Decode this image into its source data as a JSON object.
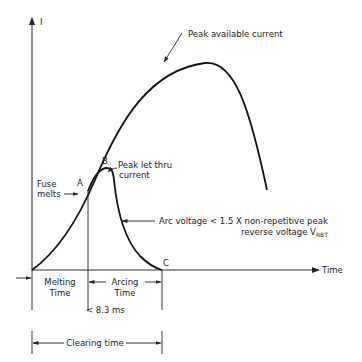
{
  "diagram": {
    "axes": {
      "y_label": "I",
      "x_label": "Time"
    },
    "points": {
      "a": "A",
      "b": "B",
      "c": "C"
    },
    "annotations": {
      "peak_available": "Peak available current",
      "peak_let_thru_line1": "Peak let thru",
      "peak_let_thru_line2": "current",
      "fuse_melts_line1": "Fuse",
      "fuse_melts_line2": "melts",
      "arc_voltage_line1": "Arc voltage < 1.5 X non-repetitive peak",
      "arc_voltage_line2": "reverse voltage V",
      "arc_voltage_subscript": "RBT"
    },
    "intervals": {
      "melting_line1": "Melting",
      "melting_line2": "Time",
      "arcing_line1": "Arcing",
      "arcing_line2": "Time",
      "total_limit": "< 8.3 ms",
      "clearing": "Clearing time"
    }
  },
  "colors": {
    "line": "#111111",
    "background": "#ffffff"
  }
}
